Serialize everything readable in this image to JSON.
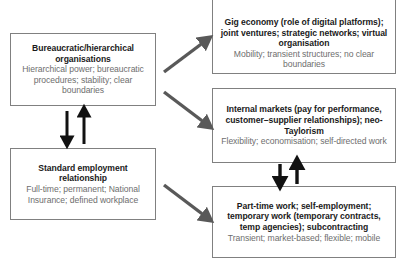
{
  "diagram": {
    "boxes": [
      {
        "id": "bureaucratic",
        "name": "bureaucratic-hierarchical-organisations",
        "title": "Bureaucratic/hierarchical organisations",
        "subtitle": "Hierarchical power; bureaucratic procedures; stability; clear boundaries"
      },
      {
        "id": "standard_employment",
        "name": "standard-employment-relationship",
        "title": "Standard employment relationship",
        "subtitle": "Full-time; permanent; National Insurance; defined workplace"
      },
      {
        "id": "gig_economy",
        "name": "gig-economy-box",
        "title": "Gig economy (role of digital platforms); joint ventures; strategic networks; virtual organisation",
        "subtitle": "Mobility; transient structures; no clear boundaries"
      },
      {
        "id": "internal_markets",
        "name": "internal-markets-box",
        "title": "Internal markets (pay for performance, customer–supplier relationships); neo-Taylorism",
        "subtitle": "Flexibility; economisation; self-directed work"
      },
      {
        "id": "part_time",
        "name": "part-time-work-box",
        "title": "Part-time work; self-employment; temporary work (temporary contracts, temp agencies); subcontracting",
        "subtitle": "Transient; market-based; flexible; mobile"
      }
    ],
    "arrows": [
      {
        "name": "arrow-bureaucratic-to-standard-down",
        "direction": "down",
        "style": "black-solid"
      },
      {
        "name": "arrow-standard-to-bureaucratic-up",
        "direction": "up",
        "style": "black-solid"
      },
      {
        "name": "arrow-bureaucratic-to-gig-economy",
        "direction": "up-right",
        "style": "gray-diagonal"
      },
      {
        "name": "arrow-bureaucratic-to-internal-markets",
        "direction": "down-right",
        "style": "gray-diagonal"
      },
      {
        "name": "arrow-standard-to-part-time",
        "direction": "down-right",
        "style": "gray-diagonal"
      },
      {
        "name": "arrow-internal-markets-to-part-time-down",
        "direction": "down",
        "style": "black-solid"
      },
      {
        "name": "arrow-part-time-to-internal-markets-up",
        "direction": "up",
        "style": "black-solid"
      }
    ],
    "colors": {
      "box_border": "#808080",
      "title_text": "#1a1a1a",
      "subtitle_text": "#6e6e6e",
      "arrow_black": "#111111",
      "arrow_gray": "#595959",
      "background": "#ffffff"
    }
  }
}
